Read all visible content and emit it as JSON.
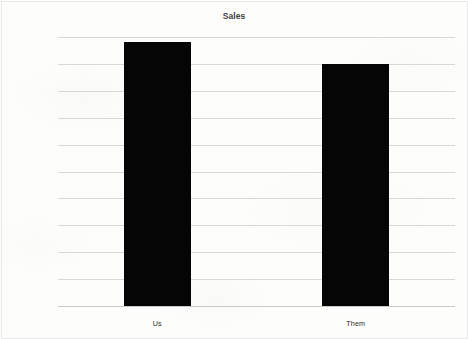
{
  "chart_data": {
    "type": "bar",
    "title": "Sales",
    "xlabel": "",
    "ylabel": "",
    "categories": [
      "Us",
      "Them"
    ],
    "values": [
      490000,
      450000
    ],
    "series": [
      {
        "name": "Sales",
        "values": [
          490000,
          450000
        ]
      }
    ],
    "ylim": [
      0,
      500000
    ],
    "ytick_labels": [
      "0",
      "50000",
      "100000",
      "150000",
      "200000",
      "250000",
      "300000",
      "350000",
      "400000",
      "450000",
      "500000"
    ],
    "ytick_values": [
      0,
      50000,
      100000,
      150000,
      200000,
      250000,
      300000,
      350000,
      400000,
      450000,
      500000
    ],
    "grid": true,
    "legend": false,
    "legend_position": "none",
    "bar_color": "#050505",
    "gridline_color": "#d8d8d8",
    "text_color": "#2b2b2b",
    "background_color": "#fdfdfc"
  }
}
